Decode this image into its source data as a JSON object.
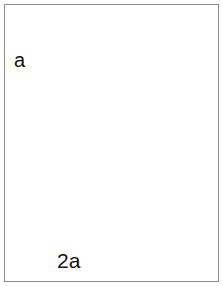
{
  "figure": {
    "domain": "medical-surgical-illustration",
    "frame": {
      "width_px": 223,
      "height_px": 286,
      "border_color": "#8c8c8c",
      "background_color": "#ffffff"
    }
  },
  "annotations": {
    "label_a": "a",
    "label_2a": "2a",
    "label_a_meaning": "edge distance of suture bite",
    "label_2a_meaning": "spacing between adjacent sutures, twice a"
  },
  "colors": {
    "ink": "#1a1a1a",
    "rim_dark": "#3c3c3c",
    "tissue_light": "#e8e8e8",
    "tissue_mid": "#bdbdbd",
    "tissue_shade": "#9a9a9a",
    "graft_fill": "#c9c9c9",
    "lumen_fill": "#b4b4b4",
    "clamp_fill": "#cfcfcf",
    "hatch": "#cdcdcd",
    "white": "#ffffff"
  },
  "elements": {
    "vessel_graft": "tubular graft with dark elliptical cut rim at left",
    "host_tissue": "shaded hatched tissue wall at right",
    "clamp": "forceps / clamp arm crossing diagonally with serrated dots and ring hole",
    "suture_thread": "curved suture thread exiting top right",
    "dimension_a": "two near-parallel leader lines with opposing vertical arrows marking distance a",
    "dimension_2a": "two long leader lines with opposing horizontal arrows marking distance 2a"
  }
}
